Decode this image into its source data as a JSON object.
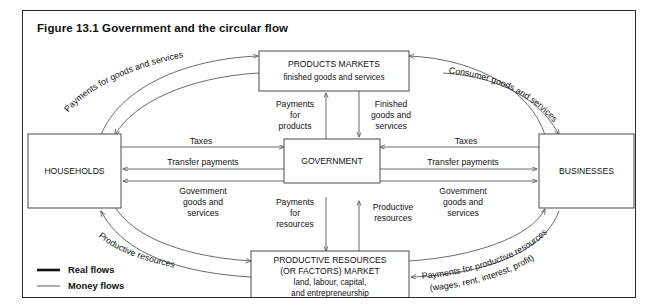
{
  "figure": {
    "title": "Figure 13.1 Government and the circular flow"
  },
  "boxes": {
    "products_markets": {
      "line1": "PRODUCTS MARKETS",
      "line2": "finished goods and services"
    },
    "households": {
      "line1": "HOUSEHOLDS"
    },
    "government": {
      "line1": "GOVERNMENT"
    },
    "businesses": {
      "line1": "BUSINESSES"
    },
    "productive_resources": {
      "line1": "PRODUCTIVE RESOURCES",
      "line2": "(OR FACTORS) MARKET",
      "line3": "land, labour, capital,",
      "line4": "and entrepreneurship"
    }
  },
  "flow_labels": {
    "payments_goods_services": "Payments for goods and services",
    "consumer_goods_services": "Consumer goods and services",
    "productive_resources_curve": "Productive resources",
    "payments_productive_resources_line1": "Payments for productive resources",
    "payments_productive_resources_line2": "(wages, rent, interest, profit)",
    "payments_for_products_l1": "Payments",
    "payments_for_products_l2": "for",
    "payments_for_products_l3": "products",
    "finished_goods_l1": "Finished",
    "finished_goods_l2": "goods and",
    "finished_goods_l3": "services",
    "payments_for_resources_l1": "Payments",
    "payments_for_resources_l2": "for",
    "payments_for_resources_l3": "resources",
    "productive_resources_up_l1": "Productive",
    "productive_resources_up_l2": "resources",
    "taxes_left": "Taxes",
    "taxes_right": "Taxes",
    "transfer_payments_left": "Transfer payments",
    "transfer_payments_right": "Transfer payments",
    "government_goods_left_l1": "Government",
    "government_goods_left_l2": "goods and",
    "government_goods_left_l3": "services",
    "government_goods_right_l1": "Government",
    "government_goods_right_l2": "goods and",
    "government_goods_right_l3": "services"
  },
  "legend": {
    "real_flows": "Real flows",
    "money_flows": "Money flows"
  },
  "colors": {
    "frame_border": "#2b2b2b",
    "box_stroke": "#4a4a4a",
    "flow_stroke": "#5a5a5a",
    "text": "#111111",
    "background": "#ffffff"
  }
}
